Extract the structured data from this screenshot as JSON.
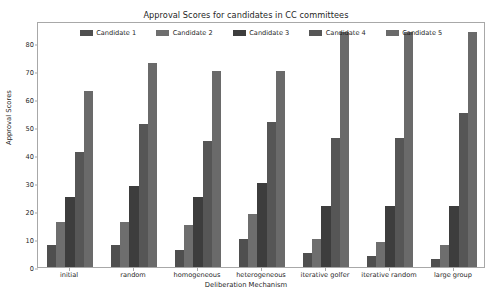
{
  "chart_data": {
    "type": "bar",
    "title": "Approval Scores for candidates in CC committees",
    "xlabel": "Deliberation Mechanism",
    "ylabel": "Approval Scores",
    "categories": [
      "initial",
      "random",
      "homogeneous",
      "heterogeneous",
      "iterative golfer",
      "iterative random",
      "large group"
    ],
    "series": [
      {
        "name": "Candidate 1",
        "color": "#4f4f4f",
        "values": [
          8,
          8,
          6,
          10,
          5,
          4,
          3
        ]
      },
      {
        "name": "Candidate 2",
        "color": "#6e6e6e",
        "values": [
          16,
          16,
          15,
          19,
          10,
          9,
          8
        ]
      },
      {
        "name": "Candidate 3",
        "color": "#3d3d3d",
        "values": [
          25,
          29,
          25,
          30,
          22,
          22,
          22
        ]
      },
      {
        "name": "Candidate 4",
        "color": "#565656",
        "values": [
          41,
          51,
          45,
          52,
          46,
          46,
          55
        ]
      },
      {
        "name": "Candidate 5",
        "color": "#6a6a6a",
        "values": [
          63,
          73,
          70,
          70,
          84,
          84,
          84
        ]
      }
    ],
    "ylim": [
      0,
      88
    ],
    "yticks": [
      0,
      10,
      20,
      30,
      40,
      50,
      60,
      70,
      80
    ],
    "grid": false,
    "legend_position": "upper center"
  }
}
